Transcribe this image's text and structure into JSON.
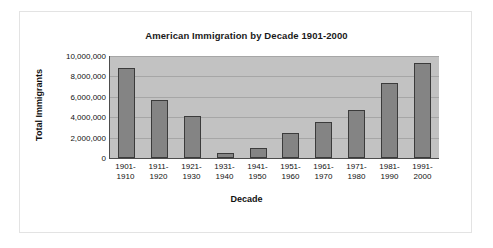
{
  "chart_data": {
    "type": "bar",
    "title": "American Immigration by Decade 1901-2000",
    "xlabel": "Decade",
    "ylabel": "Total Immigrants",
    "categories": [
      "1901-\n1910",
      "1911-\n1920",
      "1921-\n1930",
      "1931-\n1940",
      "1941-\n1950",
      "1951-\n1960",
      "1961-\n1970",
      "1971-\n1980",
      "1981-\n1990",
      "1991-\n2000"
    ],
    "category_lines": [
      [
        "1901-",
        "1910"
      ],
      [
        "1911-",
        "1920"
      ],
      [
        "1921-",
        "1930"
      ],
      [
        "1931-",
        "1940"
      ],
      [
        "1941-",
        "1950"
      ],
      [
        "1951-",
        "1960"
      ],
      [
        "1961-",
        "1970"
      ],
      [
        "1971-",
        "1980"
      ],
      [
        "1981-",
        "1990"
      ],
      [
        "1991-",
        "2000"
      ]
    ],
    "values": [
      8800000,
      5700000,
      4100000,
      500000,
      1000000,
      2500000,
      3500000,
      4700000,
      7400000,
      9300000
    ],
    "ylim": [
      0,
      10000000
    ],
    "ytick_values": [
      10000000,
      8000000,
      6000000,
      4000000,
      2000000,
      0
    ],
    "ytick_labels": [
      "10,000,000",
      "8,000,000",
      "6,000,000",
      "4,000,000",
      "2,000,000",
      "0"
    ],
    "grid": true,
    "legend": null,
    "colors": {
      "bar_fill": "#848484",
      "bar_border": "#3b3b3b",
      "plot_background": "#c2c2c2",
      "gridline": "#a6a6a6",
      "axis": "#4d4d4d",
      "text": "#111111",
      "frame_border": "#e3e3e3"
    }
  }
}
